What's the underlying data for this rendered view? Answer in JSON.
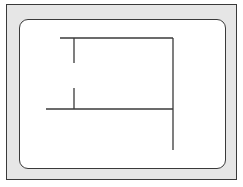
{
  "diagram": {
    "frame": {
      "fill": "#e6e6e6",
      "stroke": "#3a3a3a"
    },
    "screen": {
      "fill": "#ffffff",
      "stroke": "#3a3a3a"
    },
    "line_color": "#3a3a3a",
    "lines": [
      {
        "id": "top-horizontal",
        "x1": 60,
        "y1": 38,
        "x2": 173,
        "y2": 38
      },
      {
        "id": "right-vertical",
        "x1": 173,
        "y1": 38,
        "x2": 173,
        "y2": 150
      },
      {
        "id": "left-vertical-upper",
        "x1": 74,
        "y1": 38,
        "x2": 74,
        "y2": 63
      },
      {
        "id": "left-vertical-lower",
        "x1": 74,
        "y1": 88,
        "x2": 74,
        "y2": 109
      },
      {
        "id": "middle-horizontal",
        "x1": 46,
        "y1": 109,
        "x2": 173,
        "y2": 109
      }
    ]
  },
  "caption": ""
}
